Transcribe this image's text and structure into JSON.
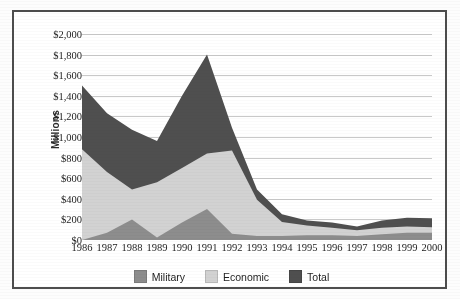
{
  "chart_data": {
    "type": "area",
    "stacked": false,
    "title": "",
    "xlabel": "",
    "ylabel": "Millions",
    "categories": [
      "1986",
      "1987",
      "1988",
      "1989",
      "1990",
      "1991",
      "1992",
      "1993",
      "1994",
      "1995",
      "1996",
      "1997",
      "1998",
      "1999",
      "2000"
    ],
    "ylim": [
      0,
      2000
    ],
    "ytick_step": 200,
    "ytick_labels": [
      "$2,000",
      "$1,800",
      "$1,600",
      "$1,400",
      "$1,200",
      "$1,000",
      "$800",
      "$600",
      "$400",
      "$200",
      "$0"
    ],
    "ytick_values": [
      2000,
      1800,
      1600,
      1400,
      1200,
      1000,
      800,
      600,
      400,
      200,
      0
    ],
    "grid": true,
    "legend_position": "bottom",
    "series": [
      {
        "name": "Total",
        "color": "#4f4f4f",
        "values": [
          1500,
          1230,
          1070,
          960,
          1400,
          1800,
          1090,
          490,
          250,
          190,
          170,
          130,
          190,
          215,
          210
        ]
      },
      {
        "name": "Economic",
        "color": "#d2d2d2",
        "values": [
          880,
          660,
          490,
          560,
          700,
          840,
          870,
          390,
          175,
          140,
          120,
          95,
          120,
          130,
          125
        ]
      },
      {
        "name": "Military",
        "color": "#8d8d8d",
        "values": [
          0,
          70,
          200,
          25,
          170,
          300,
          60,
          40,
          40,
          45,
          45,
          40,
          55,
          70,
          70
        ]
      }
    ],
    "legend": [
      {
        "label": "Military",
        "color": "#8d8d8d"
      },
      {
        "label": "Economic",
        "color": "#d2d2d2"
      },
      {
        "label": "Total",
        "color": "#4f4f4f"
      }
    ]
  }
}
